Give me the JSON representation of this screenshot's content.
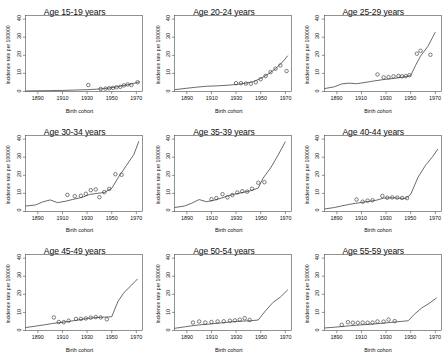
{
  "figure": {
    "layout": {
      "rows": 3,
      "cols": 3
    },
    "axis": {
      "xlabel": "Birth cohort",
      "ylabel": "Incidence rate per 100000",
      "xticks": [
        1890,
        1910,
        1930,
        1950,
        1970
      ],
      "yticks": [
        0,
        10,
        20,
        30,
        40
      ],
      "xlim": [
        1880,
        1975
      ],
      "ylim": [
        0,
        42
      ]
    },
    "style": {
      "line_color": "#3a3a3a",
      "point_color": "#3a3a3a",
      "axis_color": "#4a4a4a",
      "background": "#ffffff",
      "point_marker": "open-circle"
    }
  },
  "chart_data": [
    {
      "type": "line",
      "title": "Age 15-19 years",
      "xlabel": "Birth cohort",
      "ylabel": "Incidence rate per 100000",
      "xlim": [
        1880,
        1975
      ],
      "ylim": [
        0,
        42
      ],
      "xticks": [
        1890,
        1910,
        1930,
        1950,
        1970
      ],
      "yticks": [
        0,
        10,
        20,
        30,
        40
      ],
      "grid": false,
      "legend": "none",
      "series": [
        {
          "name": "Fitted cohort effect",
          "kind": "line",
          "x": [
            1880,
            1890,
            1900,
            1910,
            1920,
            1930,
            1938,
            1944,
            1950,
            1956,
            1962,
            1968,
            1973
          ],
          "values": [
            0.3,
            0.4,
            0.5,
            0.6,
            0.8,
            1.0,
            1.3,
            1.6,
            2.1,
            2.8,
            3.6,
            4.5,
            5.4
          ]
        },
        {
          "name": "Observed rates",
          "kind": "points",
          "x": [
            1931,
            1941,
            1945,
            1948,
            1951,
            1954,
            1957,
            1960,
            1963,
            1966,
            1971
          ],
          "values": [
            3.6,
            1.4,
            1.6,
            1.8,
            2.0,
            2.3,
            2.6,
            3.4,
            3.9,
            3.6,
            5.1
          ]
        }
      ]
    },
    {
      "type": "line",
      "title": "Age 20-24 years",
      "xlabel": "Birth cohort",
      "ylabel": "Incidence rate per 100000",
      "xlim": [
        1880,
        1975
      ],
      "ylim": [
        0,
        42
      ],
      "xticks": [
        1890,
        1910,
        1930,
        1950,
        1970
      ],
      "yticks": [
        0,
        10,
        20,
        30,
        40
      ],
      "grid": false,
      "legend": "none",
      "series": [
        {
          "name": "Fitted cohort effect",
          "kind": "line",
          "x": [
            1880,
            1890,
            1898,
            1906,
            1914,
            1922,
            1930,
            1938,
            1944,
            1950,
            1956,
            1962,
            1968,
            1972
          ],
          "values": [
            1.0,
            1.8,
            2.4,
            2.9,
            3.1,
            3.4,
            3.9,
            4.6,
            5.5,
            7.2,
            9.6,
            12.6,
            16.5,
            19.8
          ]
        },
        {
          "name": "Observed rates",
          "kind": "points",
          "x": [
            1930,
            1934,
            1938,
            1942,
            1946,
            1950,
            1954,
            1958,
            1962,
            1966,
            1971
          ],
          "values": [
            4.6,
            4.6,
            4.4,
            4.3,
            5.1,
            6.8,
            8.6,
            10.7,
            12.6,
            14.4,
            11.3
          ]
        }
      ]
    },
    {
      "type": "line",
      "title": "Age 25-29 years",
      "xlabel": "Birth cohort",
      "ylabel": "Incidence rate per 100000",
      "xlim": [
        1880,
        1975
      ],
      "ylim": [
        0,
        42
      ],
      "xticks": [
        1890,
        1910,
        1930,
        1950,
        1970
      ],
      "yticks": [
        0,
        10,
        20,
        30,
        40
      ],
      "grid": false,
      "legend": "none",
      "series": [
        {
          "name": "Fitted cohort effect",
          "kind": "line",
          "x": [
            1880,
            1888,
            1894,
            1900,
            1906,
            1912,
            1920,
            1928,
            1936,
            1944,
            1950,
            1954,
            1958,
            1964,
            1970
          ],
          "values": [
            1.6,
            2.6,
            4.2,
            4.6,
            4.3,
            4.9,
            5.8,
            6.6,
            7.2,
            8.0,
            8.8,
            14.5,
            19.6,
            25.0,
            32.8
          ]
        },
        {
          "name": "Observed rates",
          "kind": "points",
          "x": [
            1923,
            1928,
            1932,
            1936,
            1940,
            1943,
            1946,
            1949,
            1955,
            1958,
            1966
          ],
          "values": [
            9.4,
            7.8,
            7.9,
            8.4,
            8.6,
            8.4,
            8.5,
            9.0,
            20.9,
            22.5,
            20.3
          ]
        }
      ]
    },
    {
      "type": "line",
      "title": "Age 30-34 years",
      "xlabel": "Birth cohort",
      "ylabel": "Incidence rate per 100000",
      "xlim": [
        1880,
        1975
      ],
      "ylim": [
        0,
        42
      ],
      "xticks": [
        1890,
        1910,
        1930,
        1950,
        1970
      ],
      "yticks": [
        0,
        10,
        20,
        30,
        40
      ],
      "grid": false,
      "legend": "none",
      "series": [
        {
          "name": "Fitted cohort effect",
          "kind": "line",
          "x": [
            1880,
            1888,
            1894,
            1900,
            1906,
            1912,
            1918,
            1926,
            1932,
            1938,
            1944,
            1950,
            1956,
            1962,
            1968,
            1972
          ],
          "values": [
            3.0,
            3.6,
            5.3,
            6.4,
            4.9,
            5.6,
            6.6,
            7.8,
            9.4,
            10.0,
            10.5,
            12.8,
            19.5,
            25.5,
            31.5,
            38.8
          ]
        },
        {
          "name": "Observed rates",
          "kind": "points",
          "x": [
            1914,
            1920,
            1925,
            1929,
            1933,
            1937,
            1940,
            1944,
            1948,
            1953,
            1958
          ],
          "values": [
            9.2,
            8.5,
            8.7,
            9.8,
            11.8,
            12.2,
            7.9,
            10.7,
            12.5,
            20.6,
            20.3
          ]
        }
      ]
    },
    {
      "type": "line",
      "title": "Age 35-39 years",
      "xlabel": "Birth cohort",
      "ylabel": "Incidence rate per 100000",
      "xlim": [
        1880,
        1975
      ],
      "ylim": [
        0,
        42
      ],
      "xticks": [
        1890,
        1910,
        1930,
        1950,
        1970
      ],
      "yticks": [
        0,
        10,
        20,
        30,
        40
      ],
      "grid": false,
      "legend": "none",
      "series": [
        {
          "name": "Fitted cohort effect",
          "kind": "line",
          "x": [
            1880,
            1888,
            1894,
            1900,
            1906,
            1912,
            1918,
            1924,
            1930,
            1936,
            1942,
            1948,
            1952,
            1958,
            1964,
            1970
          ],
          "values": [
            2.2,
            3.0,
            4.6,
            6.6,
            5.4,
            6.2,
            7.4,
            8.8,
            9.8,
            10.6,
            11.5,
            13.0,
            18.5,
            24.0,
            31.0,
            38.6
          ]
        },
        {
          "name": "Observed rates",
          "kind": "points",
          "x": [
            1910,
            1914,
            1919,
            1923,
            1927,
            1931,
            1935,
            1939,
            1943,
            1948,
            1953
          ],
          "values": [
            6.8,
            7.4,
            9.6,
            7.8,
            9.1,
            10.5,
            11.2,
            11.0,
            12.6,
            15.9,
            16.2
          ]
        }
      ]
    },
    {
      "type": "line",
      "title": "Age 40-44 years",
      "xlabel": "Birth cohort",
      "ylabel": "Incidence rate per 100000",
      "xlim": [
        1880,
        1975
      ],
      "ylim": [
        0,
        42
      ],
      "xticks": [
        1890,
        1910,
        1930,
        1950,
        1970
      ],
      "yticks": [
        0,
        10,
        20,
        30,
        40
      ],
      "grid": false,
      "legend": "none",
      "series": [
        {
          "name": "Fitted cohort effect",
          "kind": "line",
          "x": [
            1880,
            1888,
            1896,
            1904,
            1910,
            1916,
            1922,
            1928,
            1934,
            1940,
            1946,
            1950,
            1956,
            1962,
            1968,
            1972
          ],
          "values": [
            1.4,
            2.2,
            3.4,
            4.4,
            5.0,
            5.6,
            6.2,
            7.4,
            7.6,
            7.4,
            7.2,
            9.5,
            19.0,
            25.5,
            30.5,
            34.5
          ]
        },
        {
          "name": "Observed rates",
          "kind": "points",
          "x": [
            1906,
            1911,
            1915,
            1919,
            1927,
            1931,
            1935,
            1939,
            1943,
            1947
          ],
          "values": [
            6.6,
            5.4,
            6.0,
            6.2,
            8.6,
            7.6,
            7.8,
            7.7,
            7.5,
            7.4
          ]
        }
      ]
    },
    {
      "type": "line",
      "title": "Age 45-49 years",
      "xlabel": "Birth cohort",
      "ylabel": "Incidence rate per 100000",
      "xlim": [
        1880,
        1975
      ],
      "ylim": [
        0,
        42
      ],
      "xticks": [
        1890,
        1910,
        1930,
        1950,
        1970
      ],
      "yticks": [
        0,
        10,
        20,
        30,
        40
      ],
      "grid": false,
      "legend": "none",
      "series": [
        {
          "name": "Fitted cohort effect",
          "kind": "line",
          "x": [
            1880,
            1888,
            1896,
            1902,
            1908,
            1914,
            1920,
            1926,
            1932,
            1938,
            1944,
            1950,
            1955,
            1960,
            1966,
            1971
          ],
          "values": [
            1.6,
            2.4,
            3.2,
            3.9,
            4.4,
            4.9,
            5.5,
            6.2,
            6.8,
            7.2,
            7.4,
            7.6,
            16.0,
            21.0,
            25.0,
            28.5
          ]
        },
        {
          "name": "Observed rates",
          "kind": "points",
          "x": [
            1903,
            1907,
            1911,
            1915,
            1921,
            1925,
            1929,
            1933,
            1937,
            1941,
            1946
          ],
          "values": [
            7.2,
            4.7,
            4.6,
            5.4,
            6.4,
            6.4,
            6.7,
            7.1,
            7.4,
            7.2,
            6.2
          ]
        }
      ]
    },
    {
      "type": "line",
      "title": "Age 50-54 years",
      "xlabel": "Birth cohort",
      "ylabel": "Incidence rate per 100000",
      "xlim": [
        1880,
        1975
      ],
      "ylim": [
        0,
        42
      ],
      "xticks": [
        1890,
        1910,
        1930,
        1950,
        1970
      ],
      "yticks": [
        0,
        10,
        20,
        30,
        40
      ],
      "grid": false,
      "legend": "none",
      "series": [
        {
          "name": "Fitted cohort effect",
          "kind": "line",
          "x": [
            1880,
            1888,
            1894,
            1900,
            1906,
            1912,
            1918,
            1924,
            1930,
            1936,
            1942,
            1948,
            1954,
            1960,
            1966,
            1972
          ],
          "values": [
            1.2,
            2.0,
            2.6,
            3.1,
            3.4,
            3.8,
            4.2,
            4.6,
            5.0,
            5.2,
            5.4,
            5.8,
            11.0,
            15.5,
            18.5,
            22.5
          ]
        },
        {
          "name": "Observed rates",
          "kind": "points",
          "x": [
            1895,
            1900,
            1905,
            1910,
            1915,
            1920,
            1925,
            1929,
            1933,
            1937,
            1941
          ],
          "values": [
            4.4,
            5.0,
            4.4,
            4.7,
            5.0,
            5.1,
            5.4,
            5.6,
            6.0,
            6.8,
            5.8
          ]
        }
      ]
    },
    {
      "type": "line",
      "title": "Age 55-59 years",
      "xlabel": "Birth cohort",
      "ylabel": "Incidence rate per 100000",
      "xlim": [
        1880,
        1975
      ],
      "ylim": [
        0,
        42
      ],
      "xticks": [
        1890,
        1910,
        1930,
        1950,
        1970
      ],
      "yticks": [
        0,
        10,
        20,
        30,
        40
      ],
      "grid": false,
      "legend": "none",
      "series": [
        {
          "name": "Fitted cohort effect",
          "kind": "line",
          "x": [
            1880,
            1888,
            1894,
            1900,
            1906,
            1912,
            1918,
            1924,
            1930,
            1936,
            1942,
            1948,
            1953,
            1959,
            1965,
            1971
          ],
          "values": [
            1.4,
            1.8,
            2.2,
            2.6,
            2.9,
            3.2,
            3.5,
            3.8,
            4.2,
            4.6,
            5.0,
            5.4,
            9.0,
            12.5,
            15.0,
            18.0
          ]
        },
        {
          "name": "Observed rates",
          "kind": "points",
          "x": [
            1894,
            1899,
            1903,
            1907,
            1911,
            1915,
            1919,
            1923,
            1928,
            1932,
            1937
          ],
          "values": [
            3.1,
            4.6,
            4.3,
            4.3,
            4.4,
            4.3,
            4.4,
            5.0,
            4.9,
            6.0,
            5.2
          ]
        }
      ]
    }
  ]
}
